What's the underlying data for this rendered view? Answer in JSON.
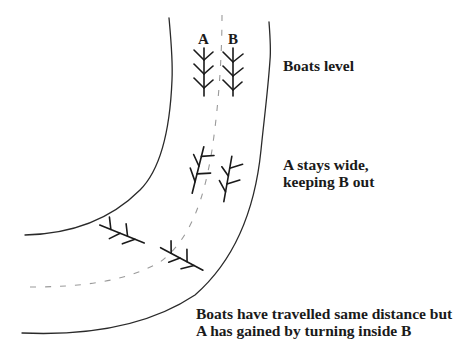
{
  "diagram": {
    "boat_labels": {
      "a": "A",
      "b": "B"
    },
    "captions": {
      "top": [
        "Boats level"
      ],
      "middle": [
        "A stays wide,",
        "keeping B out"
      ],
      "bottom": [
        "Boats have travelled same distance but",
        "A has gained by turning inside B"
      ]
    },
    "elements": {
      "inner_bank": "river-bank-inner",
      "outer_bank": "river-bank-outer",
      "center_line": "dashed-center-line",
      "boats": [
        {
          "id": "boat-a-level",
          "crew": "A",
          "stage": "level"
        },
        {
          "id": "boat-b-level",
          "crew": "B",
          "stage": "level"
        },
        {
          "id": "boat-a-wide",
          "crew": "A",
          "stage": "stays wide"
        },
        {
          "id": "boat-b-wide",
          "crew": "B",
          "stage": "stays wide"
        },
        {
          "id": "boat-a-end",
          "crew": "A",
          "stage": "after bend"
        },
        {
          "id": "boat-b-end",
          "crew": "B",
          "stage": "after bend"
        }
      ]
    },
    "colors": {
      "ink": "#1a1a1a",
      "centerline": "#9a9a9a",
      "background": "#ffffff"
    }
  }
}
